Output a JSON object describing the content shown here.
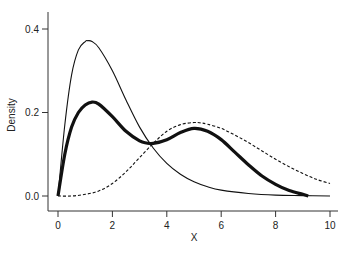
{
  "chart_data": {
    "type": "line",
    "title": "",
    "xlabel": "X",
    "ylabel": "Density",
    "xlim": [
      0,
      10
    ],
    "ylim": [
      0,
      0.4
    ],
    "x_ticks": [
      "0",
      "2",
      "4",
      "6",
      "8",
      "10"
    ],
    "y_ticks": [
      "0.0",
      "0.2",
      "0.4"
    ],
    "grid": false,
    "legend": null,
    "series": [
      {
        "name": "component-1 (thin solid)",
        "style": "thin-solid",
        "x": [
          0,
          0.25,
          0.5,
          0.75,
          1.0,
          1.1,
          1.25,
          1.5,
          2.0,
          2.5,
          3.0,
          3.5,
          4.0,
          4.5,
          5.0,
          5.5,
          6.0,
          7.0,
          8.0,
          9.0,
          10.0
        ],
        "values": [
          0.0,
          0.17,
          0.29,
          0.35,
          0.37,
          0.372,
          0.37,
          0.355,
          0.3,
          0.23,
          0.165,
          0.115,
          0.078,
          0.052,
          0.034,
          0.022,
          0.014,
          0.006,
          0.002,
          0.001,
          0.0
        ]
      },
      {
        "name": "mixture (thick solid)",
        "style": "thick-solid",
        "x": [
          0,
          0.25,
          0.5,
          0.75,
          1.0,
          1.25,
          1.5,
          2.0,
          2.5,
          3.0,
          3.25,
          3.5,
          4.0,
          4.5,
          5.0,
          5.5,
          6.0,
          6.5,
          7.0,
          7.5,
          8.0,
          8.5,
          9.0,
          9.2
        ],
        "values": [
          0.0,
          0.1,
          0.165,
          0.2,
          0.218,
          0.225,
          0.22,
          0.19,
          0.155,
          0.132,
          0.127,
          0.126,
          0.135,
          0.152,
          0.162,
          0.155,
          0.135,
          0.105,
          0.075,
          0.048,
          0.028,
          0.013,
          0.004,
          0.0
        ]
      },
      {
        "name": "component-2 (dashed)",
        "style": "dashed",
        "x": [
          0,
          0.5,
          1.0,
          1.5,
          2.0,
          2.5,
          3.0,
          3.5,
          4.0,
          4.5,
          5.0,
          5.25,
          5.5,
          6.0,
          6.5,
          7.0,
          7.5,
          8.0,
          8.5,
          9.0,
          9.5,
          10.0
        ],
        "values": [
          0.0,
          0.0,
          0.004,
          0.012,
          0.03,
          0.058,
          0.092,
          0.126,
          0.155,
          0.171,
          0.176,
          0.175,
          0.172,
          0.162,
          0.146,
          0.128,
          0.108,
          0.088,
          0.07,
          0.054,
          0.04,
          0.03
        ]
      }
    ]
  },
  "axes": {
    "x_label": "X",
    "y_label": "Density"
  }
}
